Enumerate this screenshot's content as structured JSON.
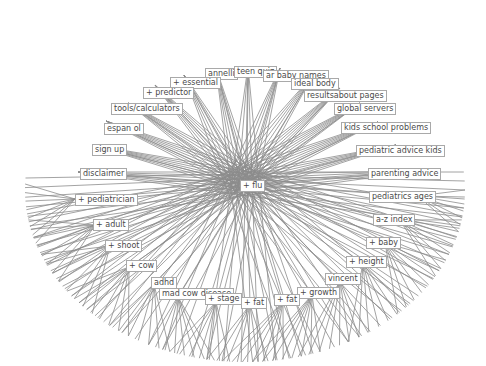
{
  "graph": {
    "center": {
      "label": "+ flu",
      "x": 240,
      "y": 180,
      "cx": 247,
      "cy": 185
    },
    "ellipse": {
      "cx": 245,
      "cy": 190,
      "rx": 220,
      "ry": 172
    },
    "colors": {
      "edge": "#8c8c8c",
      "border": "#a9a9a9",
      "text": "#4a4a4a",
      "background": "#ffffff"
    },
    "nodes": [
      {
        "label": "annelli",
        "x": 205,
        "y": 68,
        "ax": 216,
        "ay": 68,
        "a0": 252,
        "a1": 268,
        "n": 6
      },
      {
        "label": "teen quiz",
        "x": 234,
        "y": 66,
        "ax": 248,
        "ay": 66,
        "a0": 262,
        "a1": 280,
        "n": 5
      },
      {
        "label": "ar baby names",
        "x": 263,
        "y": 70,
        "ax": 280,
        "ay": 68,
        "a0": 276,
        "a1": 296,
        "n": 6
      },
      {
        "label": "ideal body",
        "x": 291,
        "y": 78,
        "ax": 313,
        "ay": 75,
        "a0": 292,
        "a1": 312,
        "n": 6
      },
      {
        "label": "+ essential",
        "x": 170,
        "y": 77,
        "ax": 184,
        "ay": 75,
        "a0": 238,
        "a1": 258,
        "n": 6
      },
      {
        "label": "resultsabout pages",
        "x": 304,
        "y": 90,
        "ax": 340,
        "ay": 88,
        "a0": 304,
        "a1": 322,
        "n": 7
      },
      {
        "label": "+ predictor",
        "x": 143,
        "y": 87,
        "ax": 155,
        "ay": 85,
        "a0": 222,
        "a1": 242,
        "n": 7
      },
      {
        "label": "tools/calculators",
        "x": 111,
        "y": 103,
        "ax": 128,
        "ay": 103,
        "a0": 208,
        "a1": 228,
        "n": 7
      },
      {
        "label": "global servers",
        "x": 334,
        "y": 103,
        "ax": 360,
        "ay": 103,
        "a0": 316,
        "a1": 334,
        "n": 7
      },
      {
        "label": "espan ol",
        "x": 104,
        "y": 123,
        "ax": 106,
        "ay": 121,
        "a0": 196,
        "a1": 214,
        "n": 7
      },
      {
        "label": "kids school problems",
        "x": 341,
        "y": 122,
        "ax": 378,
        "ay": 122,
        "a0": 326,
        "a1": 344,
        "n": 7
      },
      {
        "label": "sign up",
        "x": 92,
        "y": 144,
        "ax": 92,
        "ay": 145,
        "a0": 186,
        "a1": 202,
        "n": 7
      },
      {
        "label": "pediatric advice kids",
        "x": 356,
        "y": 145,
        "ax": 396,
        "ay": 145,
        "a0": 336,
        "a1": 352,
        "n": 7
      },
      {
        "label": "disclaimer",
        "x": 80,
        "y": 168,
        "ax": 78,
        "ay": 172,
        "a0": 174,
        "a1": 192,
        "n": 7
      },
      {
        "label": "parenting advice",
        "x": 368,
        "y": 168,
        "ax": 418,
        "ay": 171,
        "a0": 348,
        "a1": 364,
        "n": 6
      },
      {
        "label": "+ pediatrician",
        "x": 75,
        "y": 194,
        "ax": 75,
        "ay": 199,
        "a0": 162,
        "a1": 182,
        "n": 8
      },
      {
        "label": "pediatrics ages",
        "x": 369,
        "y": 191,
        "ax": 418,
        "ay": 196,
        "a0": 0,
        "a1": 14,
        "n": 7
      },
      {
        "label": "+ adult",
        "x": 93,
        "y": 219,
        "ax": 95,
        "ay": 225,
        "a0": 148,
        "a1": 170,
        "n": 8
      },
      {
        "label": "a-z index",
        "x": 373,
        "y": 214,
        "ax": 400,
        "ay": 220,
        "a0": 10,
        "a1": 30,
        "n": 8
      },
      {
        "label": "+ baby",
        "x": 366,
        "y": 237,
        "ax": 385,
        "ay": 243,
        "a0": 24,
        "a1": 46,
        "n": 8
      },
      {
        "label": "+ shoot",
        "x": 105,
        "y": 240,
        "ax": 110,
        "ay": 246,
        "a0": 134,
        "a1": 158,
        "n": 8
      },
      {
        "label": "+ height",
        "x": 346,
        "y": 256,
        "ax": 363,
        "ay": 263,
        "a0": 40,
        "a1": 62,
        "n": 8
      },
      {
        "label": "+ cow",
        "x": 126,
        "y": 260,
        "ax": 129,
        "ay": 267,
        "a0": 122,
        "a1": 144,
        "n": 8
      },
      {
        "label": "vincent",
        "x": 325,
        "y": 273,
        "ax": 340,
        "ay": 281,
        "a0": 56,
        "a1": 76,
        "n": 8
      },
      {
        "label": "adhd",
        "x": 151,
        "y": 277,
        "ax": 154,
        "ay": 284,
        "a0": 110,
        "a1": 128,
        "n": 7
      },
      {
        "label": "+ growth",
        "x": 297,
        "y": 287,
        "ax": 312,
        "ay": 295,
        "a0": 70,
        "a1": 88,
        "n": 8
      },
      {
        "label": "mad cow disease",
        "x": 159,
        "y": 288,
        "ax": 178,
        "ay": 297,
        "a0": 98,
        "a1": 114,
        "n": 7
      },
      {
        "label": "+ fat",
        "x": 274,
        "y": 294,
        "ax": 283,
        "ay": 302,
        "a0": 80,
        "a1": 96,
        "n": 7
      },
      {
        "label": "+ stage",
        "x": 205,
        "y": 293,
        "ax": 216,
        "ay": 302,
        "a0": 94,
        "a1": 110,
        "n": 7
      },
      {
        "label": "+ fat",
        "x": 241,
        "y": 297,
        "ax": 250,
        "ay": 305,
        "a0": 84,
        "a1": 100,
        "n": 7
      }
    ]
  }
}
